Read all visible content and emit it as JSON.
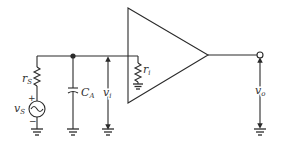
{
  "diagram": {
    "type": "amplifier-input-circuit",
    "stroke_color": "#2a2a2a",
    "background": "#ffffff",
    "components": {
      "source": {
        "label_main": "v",
        "label_sub": "S",
        "polarity_plus": "+",
        "polarity_minus": "−"
      },
      "source_resistor": {
        "label_main": "r",
        "label_sub": "S"
      },
      "capacitor": {
        "label_main": "C",
        "label_sub": "A"
      },
      "input_voltage": {
        "label_main": "v",
        "label_sub": "i"
      },
      "input_resistance": {
        "label_main": "r",
        "label_sub": "i"
      },
      "amplifier": {
        "shape": "triangle"
      },
      "output_voltage": {
        "label_main": "v",
        "label_sub": "o"
      }
    }
  }
}
